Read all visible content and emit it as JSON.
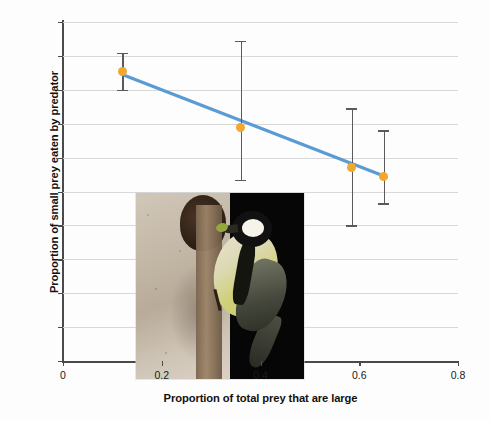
{
  "chart_data": {
    "type": "scatter",
    "title": "",
    "xlabel": "Proportion of total prey that are large",
    "ylabel": "Proportion of small prey eaten by predator",
    "xlim": [
      0,
      0.8
    ],
    "ylim": [
      0,
      1.0
    ],
    "xticks": [
      "0",
      "0.2",
      "0.4",
      "0.6",
      "0.8"
    ],
    "xtick_values": [
      0,
      0.2,
      0.4,
      0.6,
      0.8
    ],
    "yticks": [
      "0",
      "0.1",
      "0.2",
      "0.3",
      "0.4",
      "0.5",
      "0.6",
      "0.7",
      "0.8",
      "0.9",
      "1.0"
    ],
    "ytick_values": [
      0,
      0.1,
      0.2,
      0.3,
      0.4,
      0.5,
      0.6,
      0.7,
      0.8,
      0.9,
      1.0
    ],
    "grid": "horizontal",
    "legend": "none",
    "marker_color": "#f0a830",
    "line_color": "#5b9bd5",
    "errorbar_color": "#5a5a5a",
    "gridline_color": "#d8d8d8",
    "axis_color": "#4a4a4a",
    "points": [
      {
        "x": 0.12,
        "y": 0.855,
        "yerr_low": 0.8,
        "yerr_high": 0.91
      },
      {
        "x": 0.36,
        "y": 0.69,
        "yerr_low": 0.535,
        "yerr_high": 0.945
      },
      {
        "x": 0.585,
        "y": 0.57,
        "yerr_low": 0.4,
        "yerr_high": 0.745
      },
      {
        "x": 0.65,
        "y": 0.545,
        "yerr_low": 0.465,
        "yerr_high": 0.68
      }
    ],
    "trendline": {
      "x0": 0.12,
      "y0": 0.845,
      "x1": 0.655,
      "y1": 0.543
    }
  },
  "inset": {
    "name": "great-tit-at-nest-box-photo",
    "caption": ""
  }
}
